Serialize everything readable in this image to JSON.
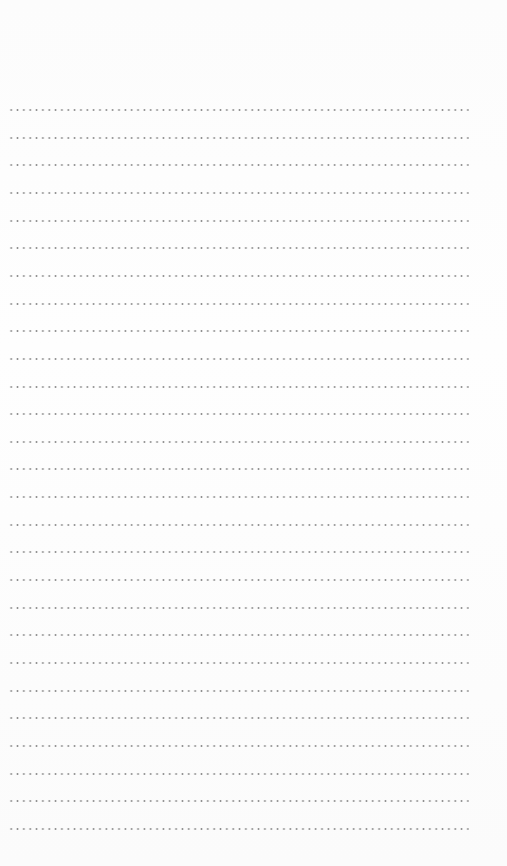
{
  "page": {
    "type": "dotted-lined-notepad",
    "line_count": 27,
    "first_line_y": 109,
    "line_spacing": 27.65,
    "dot_color": "#8f8f8f",
    "background_color": "#fdfdfd",
    "lines": []
  }
}
